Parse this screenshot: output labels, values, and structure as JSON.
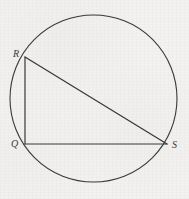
{
  "figure": {
    "background_color": "#f3f2f0",
    "stroke_color": "#3a3a3a",
    "label_color": "#3b3b3b",
    "width": 189,
    "height": 199
  },
  "circle": {
    "name": "circumscribed-circle",
    "center_x": 93.5,
    "center_y": 98.5,
    "radius": 83.5,
    "stroke_width": 1.1
  },
  "triangle": {
    "name": "triangle-QRS",
    "stroke_width": 1.2,
    "vertices": [
      {
        "label": "R",
        "x": 25,
        "y": 57,
        "label_x": 13,
        "label_y": 49
      },
      {
        "label": "Q",
        "x": 25,
        "y": 144,
        "label_x": 11,
        "label_y": 139
      },
      {
        "label": "S",
        "x": 167,
        "y": 144,
        "label_x": 172,
        "label_y": 140
      }
    ],
    "sides": [
      {
        "name": "side-RQ",
        "from": "R",
        "to": "Q"
      },
      {
        "name": "side-QS",
        "from": "Q",
        "to": "S"
      },
      {
        "name": "side-SR",
        "from": "S",
        "to": "R"
      }
    ],
    "points_path": "25,57 25,144 167,144 25,57"
  },
  "labels": {
    "R": "R",
    "Q": "Q",
    "S": "S"
  }
}
